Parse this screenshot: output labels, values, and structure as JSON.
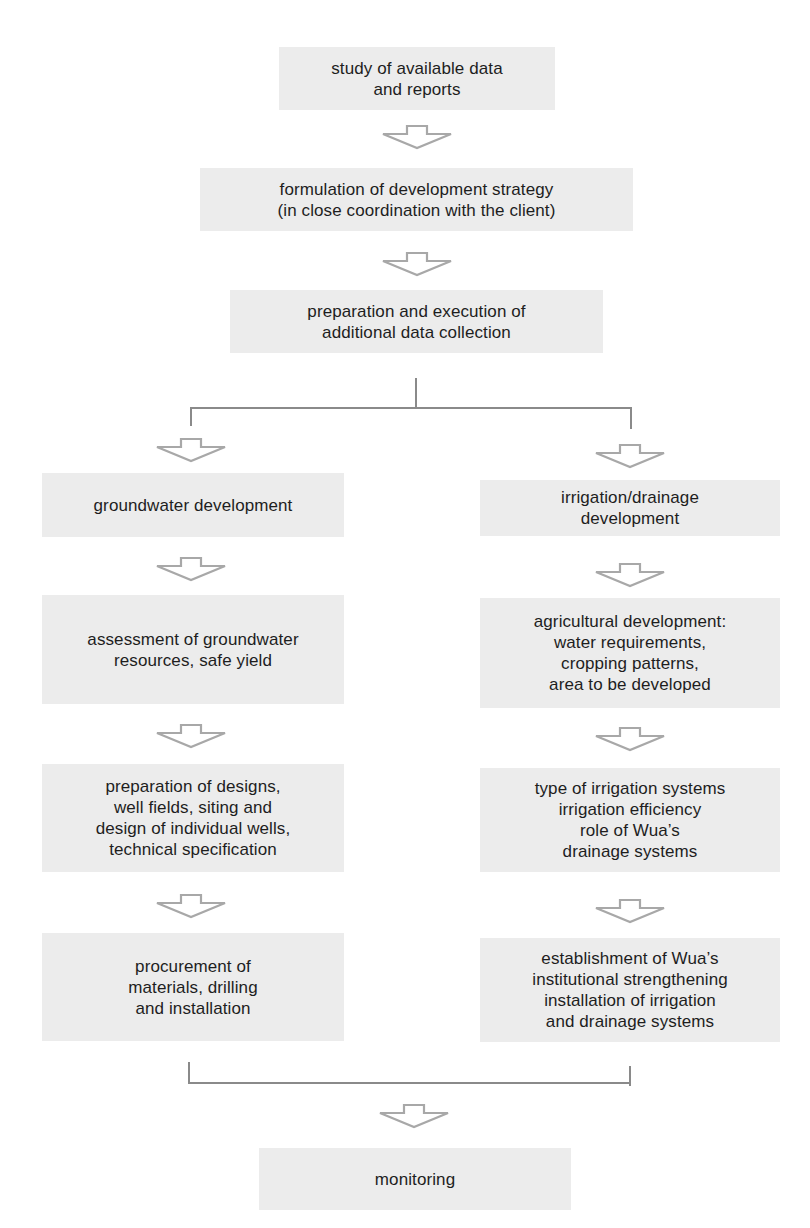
{
  "diagram": {
    "type": "flowchart",
    "colors": {
      "box_fill": "#ececec",
      "text": "#1e1e1e",
      "arrow_stroke": "#a8a8a8",
      "connector": "#8a8a8a"
    },
    "top_steps": [
      {
        "id": "study",
        "label": "study of available data\nand reports"
      },
      {
        "id": "strategy",
        "label": "formulation of development strategy\n(in close coordination with the client)"
      },
      {
        "id": "data_collection",
        "label": "preparation and execution of\nadditional data collection"
      }
    ],
    "left_branch": [
      {
        "id": "groundwater",
        "label": "groundwater development"
      },
      {
        "id": "assessment",
        "label": "assessment of groundwater\nresources, safe yield"
      },
      {
        "id": "designs",
        "label": "preparation of designs,\nwell fields, siting and\ndesign of individual wells,\ntechnical specification"
      },
      {
        "id": "procurement",
        "label": "procurement of\nmaterials, drilling\nand installation"
      }
    ],
    "right_branch": [
      {
        "id": "irrigation",
        "label": "irrigation/drainage\ndevelopment"
      },
      {
        "id": "agricultural",
        "label": "agricultural development:\nwater requirements,\ncropping patterns,\narea to be developed"
      },
      {
        "id": "irrigation_systems",
        "label": "type of irrigation systems\nirrigation efficiency\nrole of Wua’s\ndrainage systems"
      },
      {
        "id": "establishment",
        "label": "establishment of Wua’s\ninstitutional strengthening\ninstallation of irrigation\nand drainage systems"
      }
    ],
    "final_step": {
      "id": "monitoring",
      "label": "monitoring"
    }
  }
}
